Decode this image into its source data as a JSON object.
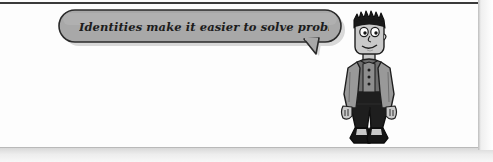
{
  "page": {
    "background_color": "#fdfdfd",
    "top_rule_color": "#3a3a3a",
    "bottom_rule_color": "#b9b9b9",
    "page_edge_color": "#bdbdbd"
  },
  "speech_bubble": {
    "text": "Identities make it easier to solve problems.",
    "fill_color": "#a8a8a8",
    "outline_color": "#2b2b2b",
    "shadow_color": "#bcbcbc",
    "tail_direction": "down-right"
  },
  "character": {
    "name": "cartoon-student",
    "pose": "standing",
    "expression": "smiling",
    "hair_color": "#1a1a1a",
    "skin_color": "#c9c9c9",
    "jacket_color": "#999999",
    "shirt_color": "#6e6e6e",
    "pants_color": "#1e1e1e",
    "shoe_color": "#1a1a1a",
    "shoe_sole_color": "#e8e8e8"
  }
}
